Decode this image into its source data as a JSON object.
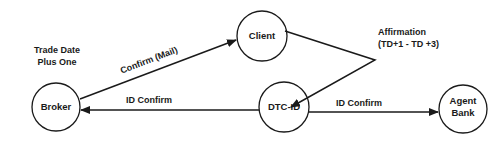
{
  "colors": {
    "stroke": "#1a1a1a",
    "background": "#ffffff"
  },
  "nodes": {
    "broker": {
      "label": "Broker"
    },
    "client": {
      "label": "Client"
    },
    "dtc": {
      "label": "DTC-ID"
    },
    "agent_bank": {
      "line1": "Agent",
      "line2": "Bank"
    }
  },
  "annotations": {
    "trade_date_line1": "Trade Date",
    "trade_date_line2": "Plus One",
    "affirmation_line1": "Affirmation",
    "affirmation_line2": "(TD+1 - TD +3)"
  },
  "edges": {
    "confirm_mail": {
      "label": "Confirm (Mail)",
      "from": "Broker",
      "to": "Client"
    },
    "affirmation": {
      "from": "Client",
      "to": "DTC-ID"
    },
    "id_confirm_broker": {
      "label": "ID Confirm",
      "from": "DTC-ID",
      "to": "Broker"
    },
    "id_confirm_agent": {
      "label": "ID Confirm",
      "from": "DTC-ID",
      "to": "Agent Bank"
    }
  }
}
